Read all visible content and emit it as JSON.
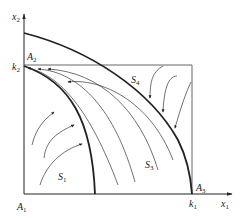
{
  "diagram": {
    "type": "phase-portrait",
    "axes": {
      "x_label": "x",
      "x_sub": "1",
      "y_label": "x",
      "y_sub": "2"
    },
    "ticks": {
      "k1": {
        "label": "k",
        "sub": "1"
      },
      "k2": {
        "label": "k",
        "sub": "2"
      }
    },
    "points": {
      "A1": {
        "label": "A",
        "sub": "1"
      },
      "A2": {
        "label": "A",
        "sub": "2"
      },
      "A3": {
        "label": "A",
        "sub": "3"
      }
    },
    "regions": {
      "S1": {
        "label": "S",
        "sub": "1"
      },
      "S3": {
        "label": "S",
        "sub": "3"
      },
      "S4": {
        "label": "S",
        "sub": "4"
      }
    },
    "colors": {
      "line": "#222222",
      "thin": "#333333",
      "box": "#555555"
    }
  }
}
